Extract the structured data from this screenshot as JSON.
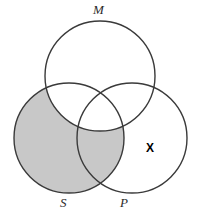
{
  "diagram": {
    "type": "venn-three-circle",
    "title": "",
    "background_color": "#ffffff",
    "stroke_color": "#3a3a3a",
    "shade_color": "#c8c8c8",
    "circles": [
      {
        "id": "M",
        "label": "M",
        "cx": 100,
        "cy": 76,
        "r": 55,
        "label_x": 93,
        "label_y": 3
      },
      {
        "id": "S",
        "label": "S",
        "cx": 69,
        "cy": 138,
        "r": 55,
        "label_x": 60,
        "label_y": 196
      },
      {
        "id": "P",
        "label": "P",
        "cx": 132,
        "cy": 138,
        "r": 55,
        "label_x": 120,
        "label_y": 196
      }
    ],
    "shaded_regions": [
      {
        "id": "S-minus-M",
        "description": "S excluding M",
        "color": "#c8c8c8"
      }
    ],
    "markers": [
      {
        "id": "x-marker",
        "symbol": "X",
        "region": "P-only",
        "x": 146,
        "y": 142
      }
    ]
  }
}
